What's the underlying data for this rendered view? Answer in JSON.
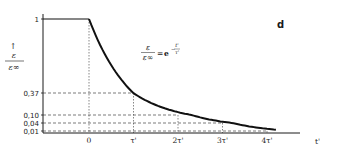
{
  "chart_data": {
    "type": "line",
    "title": "",
    "panel_label": "d",
    "xlabel": "t'",
    "ylabel": {
      "arrow": "↑",
      "numerator": "ε",
      "denominator": "ε∞"
    },
    "formula": {
      "lhs_num": "ε",
      "lhs_den": "ε∞",
      "eq": "=",
      "base": "e",
      "exp_sign": "−",
      "exp_num": "t'",
      "exp_den": "τ'"
    },
    "x_ticks": [
      "0",
      "τ'",
      "2τ'",
      "3τ'",
      "4τ'"
    ],
    "x_tick_values": [
      0,
      1,
      2,
      3,
      4
    ],
    "y_ticks": [
      "1",
      "0,37",
      "0,10",
      "0,04",
      "0,01"
    ],
    "y_tick_values": [
      1,
      0.37,
      0.1,
      0.04,
      0.01
    ],
    "xlim": [
      -1,
      5.5
    ],
    "ylim": [
      0,
      1
    ],
    "grid": false,
    "series": [
      {
        "name": "before step",
        "x": [
          -1,
          0
        ],
        "y": [
          1,
          1
        ]
      },
      {
        "name": "decay",
        "x": [
          0,
          1,
          2,
          3,
          4
        ],
        "y": [
          1,
          0.37,
          0.1,
          0.04,
          0.01
        ],
        "function": "exp(-t'/τ')"
      }
    ],
    "reference_lines": [
      {
        "value": 0.37,
        "at_x": 1
      },
      {
        "value": 0.1,
        "at_x": 2
      },
      {
        "value": 0.04,
        "at_x": 3
      },
      {
        "value": 0.01,
        "at_x": 4
      }
    ]
  }
}
